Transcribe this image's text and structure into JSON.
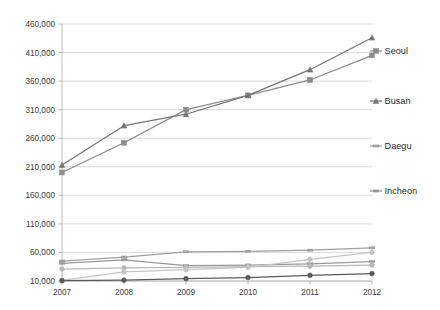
{
  "chart_data": {
    "type": "line",
    "title": "",
    "subtitle": "",
    "xlabel": "",
    "ylabel": "",
    "categories": [
      "2007",
      "2008",
      "2009",
      "2010",
      "2011",
      "2012"
    ],
    "x": [
      2007,
      2008,
      2009,
      2010,
      2011,
      2012
    ],
    "ylim": [
      10000,
      460000
    ],
    "ytick_labels": [
      "10,000",
      "60,000",
      "110,000",
      "160,000",
      "210,000",
      "260,000",
      "310,000",
      "360,000",
      "410,000",
      "460,000"
    ],
    "ytick_values": [
      10000,
      60000,
      110000,
      160000,
      210000,
      260000,
      310000,
      360000,
      410000,
      460000
    ],
    "grid": true,
    "legend_position": "right",
    "series": [
      {
        "name": "Seoul",
        "marker": "square",
        "color": "#8c8c8c",
        "values": [
          200000,
          252000,
          310000,
          335000,
          362000,
          405000
        ]
      },
      {
        "name": "Busan",
        "marker": "triangle",
        "color": "#767676",
        "values": [
          213000,
          282000,
          302000,
          335000,
          380000,
          436000
        ]
      },
      {
        "name": "Daegu",
        "marker": "dash",
        "color": "#a0a0a0",
        "values": [
          45000,
          52000,
          61000,
          62000,
          64000,
          68000
        ]
      },
      {
        "name": "Incheon",
        "marker": "dash",
        "color": "#9a9a9a",
        "values": [
          41000,
          47000,
          37000,
          38000,
          40000,
          44000
        ]
      },
      {
        "name": "",
        "marker": "circle",
        "color": "#b8b8b8",
        "values": [
          31000,
          33000,
          34000,
          35000,
          36000,
          38000
        ]
      },
      {
        "name": "",
        "marker": "circle",
        "color": "#c4c4c4",
        "values": [
          11000,
          26000,
          30000,
          34000,
          48000,
          60000
        ]
      },
      {
        "name": "",
        "marker": "circle",
        "color": "#5a5a5a",
        "values": [
          10500,
          11500,
          14000,
          16000,
          20000,
          23000
        ]
      }
    ],
    "legend_entries": [
      {
        "label": "Seoul",
        "marker": "square",
        "color": "#8c8c8c"
      },
      {
        "label": "Busan",
        "marker": "triangle",
        "color": "#767676"
      },
      {
        "label": "Daegu",
        "marker": "dash",
        "color": "#a0a0a0"
      },
      {
        "label": "Incheon",
        "marker": "dash",
        "color": "#9a9a9a"
      }
    ],
    "colors": {
      "gridline": "#d2d2d2",
      "axis": "#b4b4b4",
      "text": "#3d3d3d",
      "background": "#ffffff"
    }
  }
}
